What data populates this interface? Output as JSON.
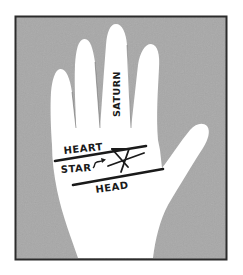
{
  "illustration": {
    "subject": "palmistry hand diagram",
    "labels": {
      "finger": "SATURN",
      "heart_line": "HEART",
      "star": "STAR",
      "head_line": "HEAD"
    },
    "colors": {
      "background": "#ffffff",
      "frame_fill": "#a9a9a9",
      "frame_border": "#2b2b2b",
      "hand": "#ffffff",
      "ink": "#1a1a1a"
    }
  }
}
